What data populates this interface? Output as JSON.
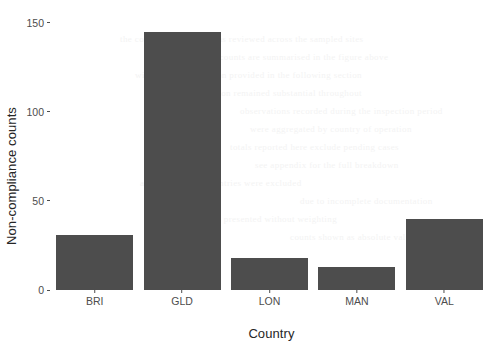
{
  "chart_data": {
    "type": "bar",
    "title": "",
    "subtitle": "",
    "xlabel": "Country",
    "ylabel": "Non-compliance counts",
    "categories": [
      "BRI",
      "GLD",
      "LON",
      "MAN",
      "VAL"
    ],
    "values": [
      31,
      145,
      18,
      13,
      40
    ],
    "series": [
      {
        "name": "Non-compliance counts",
        "values": [
          31,
          145,
          18,
          13,
          40
        ]
      }
    ],
    "ylim": [
      0,
      155
    ],
    "xlim": [
      0,
      5
    ],
    "y_ticks": [
      0,
      50,
      100,
      150
    ],
    "y_tick_labels": [
      "0",
      "50",
      "100",
      "150"
    ],
    "x_tick_labels": [
      "BRI",
      "GLD",
      "LON",
      "MAN",
      "VAL"
    ],
    "grid": false,
    "legend": false,
    "legend_position": "none",
    "bar_color": "#4d4d4d",
    "background_color": "#ffffff",
    "axis_text_color": "#4d4d4d",
    "axis_title_color": "#262626"
  },
  "ghost_text": [
    {
      "text": "the compliance record was reviewed across the sampled sites",
      "x": 120,
      "y": 34
    },
    {
      "text": "and the resulting counts are summarised in the figure above",
      "x": 150,
      "y": 52
    },
    {
      "text": "with further discussion provided in the following section",
      "x": 135,
      "y": 70
    },
    {
      "text": "regional variation remained substantial throughout",
      "x": 160,
      "y": 88
    },
    {
      "text": "observations recorded during the inspection period",
      "x": 240,
      "y": 106
    },
    {
      "text": "were aggregated by country of operation",
      "x": 250,
      "y": 124
    },
    {
      "text": "totals reported here exclude pending cases",
      "x": 230,
      "y": 142
    },
    {
      "text": "see appendix for the full breakdown",
      "x": 255,
      "y": 160
    },
    {
      "text": "a small number of entries were excluded",
      "x": 140,
      "y": 178
    },
    {
      "text": "due to incomplete documentation",
      "x": 300,
      "y": 196
    },
    {
      "text": "results are presented without weighting",
      "x": 180,
      "y": 214
    },
    {
      "text": "counts shown as absolute values",
      "x": 290,
      "y": 232
    }
  ]
}
